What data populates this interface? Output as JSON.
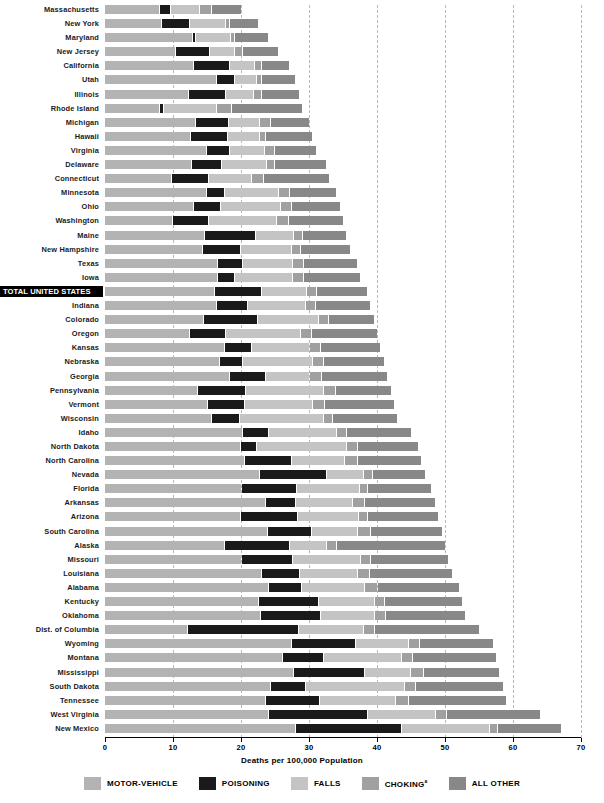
{
  "chart_data": {
    "type": "bar",
    "subtype": "stacked-horizontal",
    "title": "",
    "xlabel": "Deaths per 100,000 Population",
    "ylabel": "",
    "xlim": [
      0,
      70
    ],
    "xticks": [
      0,
      10,
      20,
      30,
      40,
      50,
      60,
      70
    ],
    "grid": true,
    "legend_position": "bottom",
    "series": [
      {
        "name": "MOTOR-VEHICLE",
        "color": "#b3b3b3"
      },
      {
        "name": "POISONING",
        "color": "#1a1a1a"
      },
      {
        "name": "FALLS",
        "color": "#c4c4c4"
      },
      {
        "name": "CHOKING",
        "color": "#a0a0a0"
      },
      {
        "name": "ALL OTHER",
        "color": "#888888"
      }
    ],
    "categories": [
      "Massachusetts",
      "New York",
      "Maryland",
      "New Jersey",
      "California",
      "Utah",
      "Illinois",
      "Rhode Island",
      "Michigan",
      "Hawaii",
      "Virginia",
      "Delaware",
      "Connecticut",
      "Minnesota",
      "Ohio",
      "Washington",
      "Maine",
      "New Hampshire",
      "Texas",
      "Iowa",
      "TOTAL UNITED STATES",
      "Indiana",
      "Colorado",
      "Oregon",
      "Kansas",
      "Nebraska",
      "Georgia",
      "Pennsylvania",
      "Vermont",
      "Wisconsin",
      "Idaho",
      "North Dakota",
      "North Carolina",
      "Nevada",
      "Florida",
      "Arkansas",
      "Arizona",
      "South Carolina",
      "Alaska",
      "Missouri",
      "Louisiana",
      "Alabama",
      "Kentucky",
      "Oklahoma",
      "Dist. of Columbia",
      "Wyoming",
      "Montana",
      "Mississippi",
      "South Dakota",
      "Tennessee",
      "West Virginia",
      "New Mexico"
    ],
    "rows": [
      {
        "state": "Massachusetts",
        "total": 20.0,
        "values": [
          8.0,
          1.5,
          4.3,
          1.8,
          4.4
        ],
        "highlight": false
      },
      {
        "state": "New York",
        "total": 22.5,
        "values": [
          8.3,
          4.0,
          5.3,
          0.7,
          4.2
        ],
        "highlight": false
      },
      {
        "state": "Maryland",
        "total": 24.0,
        "values": [
          12.8,
          0.4,
          5.2,
          0.5,
          5.1
        ],
        "highlight": false
      },
      {
        "state": "New Jersey",
        "total": 25.5,
        "values": [
          10.3,
          5.0,
          3.6,
          1.3,
          5.3
        ],
        "highlight": false
      },
      {
        "state": "California",
        "total": 27.0,
        "values": [
          13.0,
          5.2,
          3.7,
          1.1,
          4.0
        ],
        "highlight": false
      },
      {
        "state": "Utah",
        "total": 28.0,
        "values": [
          16.3,
          2.7,
          3.2,
          0.8,
          5.0
        ],
        "highlight": false
      },
      {
        "state": "Illinois",
        "total": 28.5,
        "values": [
          12.2,
          5.5,
          4.0,
          1.3,
          5.5
        ],
        "highlight": false
      },
      {
        "state": "Rhode Island",
        "total": 29.0,
        "values": [
          8.0,
          0.5,
          7.8,
          2.2,
          10.5
        ],
        "highlight": false
      },
      {
        "state": "Michigan",
        "total": 30.0,
        "values": [
          13.3,
          4.8,
          4.6,
          1.6,
          5.7
        ],
        "highlight": false
      },
      {
        "state": "Hawaii",
        "total": 30.5,
        "values": [
          12.5,
          5.5,
          4.6,
          1.0,
          6.9
        ],
        "highlight": false
      },
      {
        "state": "Virginia",
        "total": 31.0,
        "values": [
          14.8,
          3.4,
          5.2,
          1.4,
          6.2
        ],
        "highlight": false
      },
      {
        "state": "Delaware",
        "total": 32.5,
        "values": [
          12.7,
          4.4,
          6.6,
          1.2,
          7.6
        ],
        "highlight": false
      },
      {
        "state": "Connecticut",
        "total": 33.0,
        "values": [
          9.7,
          5.5,
          6.2,
          1.9,
          9.7
        ],
        "highlight": false
      },
      {
        "state": "Minnesota",
        "total": 34.0,
        "values": [
          14.9,
          2.6,
          8.0,
          1.5,
          7.0
        ],
        "highlight": false
      },
      {
        "state": "Ohio",
        "total": 34.5,
        "values": [
          13.0,
          3.9,
          8.8,
          1.7,
          7.1
        ],
        "highlight": false
      },
      {
        "state": "Washington",
        "total": 35.0,
        "values": [
          9.8,
          5.3,
          10.0,
          1.8,
          8.1
        ],
        "highlight": false
      },
      {
        "state": "Maine",
        "total": 35.5,
        "values": [
          14.5,
          7.6,
          5.6,
          1.2,
          6.6
        ],
        "highlight": false
      },
      {
        "state": "New Hampshire",
        "total": 36.0,
        "values": [
          14.2,
          5.6,
          7.5,
          1.4,
          7.3
        ],
        "highlight": false
      },
      {
        "state": "Texas",
        "total": 37.0,
        "values": [
          16.4,
          3.8,
          7.3,
          1.6,
          7.9
        ],
        "highlight": false
      },
      {
        "state": "Iowa",
        "total": 37.5,
        "values": [
          16.5,
          2.4,
          8.6,
          1.6,
          8.4
        ],
        "highlight": false
      },
      {
        "state": "TOTAL UNITED STATES",
        "total": 38.5,
        "values": [
          16.0,
          7.0,
          6.5,
          1.5,
          7.5
        ],
        "highlight": true
      },
      {
        "state": "Indiana",
        "total": 39.0,
        "values": [
          16.3,
          4.6,
          8.5,
          1.5,
          8.1
        ],
        "highlight": false
      },
      {
        "state": "Colorado",
        "total": 39.5,
        "values": [
          14.4,
          8.0,
          8.9,
          1.5,
          6.7
        ],
        "highlight": false
      },
      {
        "state": "Oregon",
        "total": 40.0,
        "values": [
          12.3,
          5.4,
          11.0,
          1.6,
          9.7
        ],
        "highlight": false
      },
      {
        "state": "Kansas",
        "total": 40.5,
        "values": [
          17.5,
          3.9,
          8.6,
          1.6,
          8.9
        ],
        "highlight": false
      },
      {
        "state": "Nebraska",
        "total": 41.0,
        "values": [
          16.7,
          3.5,
          10.3,
          1.6,
          8.9
        ],
        "highlight": false
      },
      {
        "state": "Georgia",
        "total": 41.5,
        "values": [
          18.2,
          5.3,
          6.5,
          1.8,
          9.7
        ],
        "highlight": false
      },
      {
        "state": "Pennsylvania",
        "total": 42.0,
        "values": [
          13.6,
          7.0,
          11.5,
          1.7,
          8.2
        ],
        "highlight": false
      },
      {
        "state": "Vermont",
        "total": 42.5,
        "values": [
          15.0,
          5.5,
          10.0,
          1.7,
          10.3
        ],
        "highlight": false
      },
      {
        "state": "Wisconsin",
        "total": 43.0,
        "values": [
          15.6,
          4.1,
          12.3,
          1.4,
          9.6
        ],
        "highlight": false
      },
      {
        "state": "Idaho",
        "total": 45.0,
        "values": [
          20.1,
          3.9,
          10.0,
          1.5,
          9.5
        ],
        "highlight": false
      },
      {
        "state": "North Dakota",
        "total": 46.0,
        "values": [
          19.9,
          2.3,
          13.3,
          1.6,
          8.9
        ],
        "highlight": false
      },
      {
        "state": "North Carolina",
        "total": 46.5,
        "values": [
          20.4,
          6.9,
          7.9,
          1.8,
          9.5
        ],
        "highlight": false
      },
      {
        "state": "Nevada",
        "total": 47.0,
        "values": [
          22.6,
          9.9,
          5.4,
          1.3,
          7.8
        ],
        "highlight": false
      },
      {
        "state": "Florida",
        "total": 48.0,
        "values": [
          20.0,
          8.1,
          9.2,
          1.3,
          9.4
        ],
        "highlight": false
      },
      {
        "state": "Arkansas",
        "total": 48.5,
        "values": [
          23.5,
          4.4,
          8.4,
          1.8,
          10.4
        ],
        "highlight": false
      },
      {
        "state": "Arizona",
        "total": 49.0,
        "values": [
          19.8,
          8.4,
          9.0,
          1.4,
          10.4
        ],
        "highlight": false
      },
      {
        "state": "South Carolina",
        "total": 49.5,
        "values": [
          23.8,
          6.5,
          6.8,
          1.9,
          10.5
        ],
        "highlight": false
      },
      {
        "state": "Alaska",
        "total": 50.0,
        "values": [
          17.5,
          9.5,
          5.5,
          1.5,
          16.0
        ],
        "highlight": false
      },
      {
        "state": "Missouri",
        "total": 50.5,
        "values": [
          20.0,
          7.5,
          10.0,
          1.5,
          11.5
        ],
        "highlight": false
      },
      {
        "state": "Louisiana",
        "total": 51.0,
        "values": [
          23.0,
          5.5,
          8.5,
          1.8,
          12.2
        ],
        "highlight": false
      },
      {
        "state": "Alabama",
        "total": 52.0,
        "values": [
          24.0,
          4.8,
          9.3,
          1.9,
          12.0
        ],
        "highlight": false
      },
      {
        "state": "Kentucky",
        "total": 52.5,
        "values": [
          22.5,
          8.8,
          8.2,
          1.6,
          11.4
        ],
        "highlight": false
      },
      {
        "state": "Oklahoma",
        "total": 53.0,
        "values": [
          22.8,
          8.8,
          8.0,
          1.6,
          11.8
        ],
        "highlight": false
      },
      {
        "state": "Dist. of Columbia",
        "total": 55.0,
        "values": [
          12.0,
          16.4,
          9.5,
          1.6,
          15.5
        ],
        "highlight": false
      },
      {
        "state": "Wyoming",
        "total": 57.0,
        "values": [
          27.3,
          9.4,
          7.8,
          1.7,
          10.8
        ],
        "highlight": false
      },
      {
        "state": "Montana",
        "total": 57.5,
        "values": [
          26.0,
          6.0,
          11.5,
          1.6,
          12.4
        ],
        "highlight": false
      },
      {
        "state": "Mississippi",
        "total": 58.0,
        "values": [
          27.6,
          10.5,
          6.8,
          1.8,
          11.3
        ],
        "highlight": false
      },
      {
        "state": "South Dakota",
        "total": 58.5,
        "values": [
          24.2,
          5.2,
          14.6,
          1.6,
          12.9
        ],
        "highlight": false
      },
      {
        "state": "Tennessee",
        "total": 59.0,
        "values": [
          23.5,
          8.0,
          11.2,
          1.9,
          14.4
        ],
        "highlight": false
      },
      {
        "state": "West Virginia",
        "total": 64.0,
        "values": [
          24.0,
          14.5,
          10.0,
          1.6,
          13.9
        ],
        "highlight": false
      },
      {
        "state": "New Mexico",
        "total": 67.0,
        "values": [
          28.0,
          15.5,
          13.0,
          1.2,
          9.3
        ],
        "highlight": false
      }
    ]
  },
  "axis": {
    "x_tick_labels": [
      "0",
      "10",
      "20",
      "30",
      "40",
      "50",
      "60",
      "70"
    ],
    "x_title": "Deaths per 100,000 Population"
  },
  "legend": {
    "items": [
      {
        "label": "MOTOR-VEHICLE",
        "color": "#b3b3b3",
        "superscript": ""
      },
      {
        "label": "POISONING",
        "color": "#1a1a1a",
        "superscript": ""
      },
      {
        "label": "FALLS",
        "color": "#c4c4c4",
        "superscript": ""
      },
      {
        "label": "CHOKING",
        "color": "#a0a0a0",
        "superscript": "a"
      },
      {
        "label": "ALL OTHER",
        "color": "#888888",
        "superscript": ""
      }
    ]
  }
}
